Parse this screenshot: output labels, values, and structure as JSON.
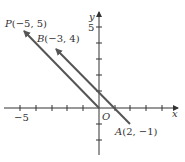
{
  "figure": {
    "type": "vector-diagram",
    "axes": {
      "x_label": "x",
      "y_label": "y",
      "origin_label": "O",
      "x_tick_label": "−5",
      "y_tick_label": "5",
      "x_range": [
        -6,
        5
      ],
      "y_range": [
        -3,
        6
      ]
    },
    "points": {
      "P": {
        "label": "P(−5, 5)",
        "x": -5,
        "y": 5
      },
      "B": {
        "label": "B(−3, 4)",
        "x": -3,
        "y": 4
      },
      "A": {
        "label": "A(2, −1)",
        "x": 2,
        "y": -1
      },
      "O": {
        "label": "O",
        "x": 0,
        "y": 0
      }
    },
    "vectors": [
      {
        "name": "OP",
        "from": "O",
        "to": "P"
      },
      {
        "name": "AB",
        "from": "A",
        "to": "B"
      }
    ],
    "colors": {
      "line": "#555555",
      "axis": "#333333",
      "text": "#333333"
    }
  }
}
